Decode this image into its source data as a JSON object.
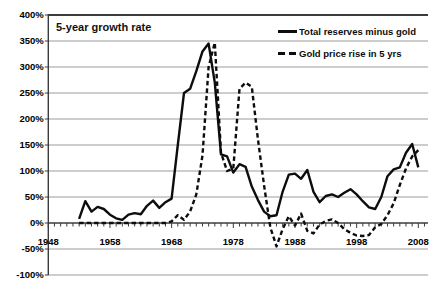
{
  "chart_data": {
    "type": "line",
    "title": "5-year growth rate",
    "x": [
      1953,
      1954,
      1955,
      1956,
      1957,
      1958,
      1959,
      1960,
      1961,
      1962,
      1963,
      1964,
      1965,
      1966,
      1967,
      1968,
      1969,
      1970,
      1971,
      1972,
      1973,
      1974,
      1975,
      1976,
      1977,
      1978,
      1979,
      1980,
      1981,
      1982,
      1983,
      1984,
      1985,
      1986,
      1987,
      1988,
      1989,
      1990,
      1991,
      1992,
      1993,
      1994,
      1995,
      1996,
      1997,
      1998,
      1999,
      2000,
      2001,
      2002,
      2003,
      2004,
      2005,
      2006,
      2007,
      2008
    ],
    "series": [
      {
        "name": "Total reserves minus gold",
        "style": "solid",
        "values": [
          8,
          42,
          22,
          31,
          27,
          16,
          9,
          6,
          16,
          19,
          17,
          33,
          43,
          29,
          40,
          47,
          150,
          250,
          258,
          292,
          330,
          345,
          270,
          132,
          128,
          97,
          113,
          108,
          70,
          44,
          22,
          13,
          15,
          60,
          93,
          95,
          85,
          102,
          60,
          40,
          52,
          55,
          50,
          58,
          65,
          55,
          42,
          30,
          27,
          50,
          90,
          103,
          107,
          135,
          152,
          107
        ]
      },
      {
        "name": "Gold price rise in 5 yrs",
        "style": "dashed",
        "values": [
          0,
          0,
          0,
          0,
          0,
          0,
          0,
          0,
          0,
          0,
          0,
          0,
          0,
          0,
          0,
          3,
          15,
          6,
          22,
          55,
          130,
          300,
          347,
          135,
          100,
          105,
          258,
          270,
          262,
          160,
          72,
          -8,
          -45,
          -12,
          13,
          -5,
          18,
          -15,
          -20,
          -3,
          4,
          7,
          0,
          -12,
          -19,
          -24,
          -25,
          -23,
          -8,
          -2,
          15,
          38,
          73,
          105,
          128,
          140
        ]
      }
    ],
    "xlabel": "",
    "ylabel": "",
    "x_axis": {
      "min": 1948,
      "max": 2009,
      "tick_years": [
        1948,
        1958,
        1968,
        1978,
        1988,
        1998,
        2008
      ],
      "tick_labels": [
        "1948",
        "1958",
        "1968",
        "1978",
        "1988",
        "1998",
        "2008"
      ],
      "minor_tick_interval_years": 1
    },
    "y_axis": {
      "min": -100,
      "max": 400,
      "step": 50,
      "unit": "%",
      "tick_labels": [
        "400%",
        "350%",
        "300%",
        "250%",
        "200%",
        "150%",
        "100%",
        "50%",
        "0%",
        "-50%",
        "-100%"
      ]
    },
    "grid": true,
    "legend_position": "top-right",
    "colors": {
      "line": "#0d0d0d",
      "grid": "#9b9b9b",
      "axis": "#3c3c3c",
      "text": "#000000",
      "background": "#ffffff"
    }
  }
}
